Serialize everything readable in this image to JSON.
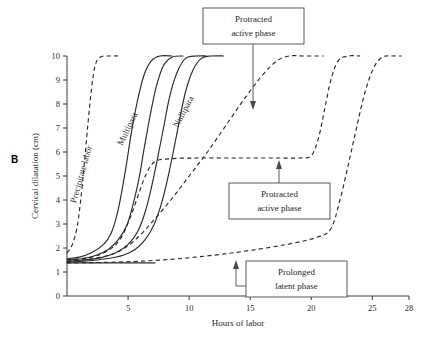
{
  "figure": {
    "panel_label": "B"
  },
  "chart_data": {
    "type": "line",
    "title": "",
    "xlabel": "Hours of labor",
    "ylabel": "Cervical dilatation (cm)",
    "xlim": [
      0,
      28
    ],
    "ylim": [
      0,
      10
    ],
    "xticks": [
      5,
      10,
      15,
      20,
      25,
      28
    ],
    "yticks": [
      0,
      1,
      2,
      3,
      4,
      5,
      6,
      7,
      8,
      9,
      10
    ],
    "xtick_labels": [
      "5",
      "10",
      "15",
      "20",
      "25",
      "28"
    ],
    "ytick_labels": [
      "0",
      "1",
      "2",
      "3",
      "4",
      "5",
      "6",
      "7",
      "8",
      "9",
      "10"
    ],
    "grid": false,
    "legend_position": "inline-curve-labels",
    "series": [
      {
        "name": "Precipitate labor",
        "style": "dashed",
        "label_on_curve": "Precipitate labor",
        "points": [
          [
            0.0,
            1.8
          ],
          [
            0.4,
            2.1
          ],
          [
            0.8,
            2.8
          ],
          [
            1.1,
            3.9
          ],
          [
            1.4,
            5.4
          ],
          [
            1.7,
            7.1
          ],
          [
            2.0,
            8.6
          ],
          [
            2.3,
            9.6
          ],
          [
            2.7,
            9.95
          ],
          [
            3.4,
            10.0
          ],
          [
            4.2,
            10.0
          ]
        ]
      },
      {
        "name": "Multipara (normal)",
        "style": "solid",
        "label_on_curve": "Multipara",
        "points": [
          [
            0.0,
            1.55
          ],
          [
            1.0,
            1.62
          ],
          [
            2.0,
            1.8
          ],
          [
            3.0,
            2.15
          ],
          [
            3.6,
            2.6
          ],
          [
            4.1,
            3.4
          ],
          [
            4.5,
            4.4
          ],
          [
            4.9,
            5.6
          ],
          [
            5.3,
            6.9
          ],
          [
            5.8,
            8.2
          ],
          [
            6.3,
            9.2
          ],
          [
            6.9,
            9.8
          ],
          [
            7.6,
            10.0
          ],
          [
            8.6,
            10.0
          ]
        ]
      },
      {
        "name": "Normal curve 2",
        "style": "solid",
        "label_on_curve": "",
        "points": [
          [
            0.0,
            1.5
          ],
          [
            1.2,
            1.55
          ],
          [
            2.4,
            1.7
          ],
          [
            3.4,
            1.95
          ],
          [
            4.2,
            2.35
          ],
          [
            4.9,
            2.95
          ],
          [
            5.4,
            3.8
          ],
          [
            5.9,
            4.9
          ],
          [
            6.3,
            6.1
          ],
          [
            6.8,
            7.5
          ],
          [
            7.3,
            8.7
          ],
          [
            7.9,
            9.6
          ],
          [
            8.6,
            9.95
          ],
          [
            9.5,
            10.0
          ]
        ]
      },
      {
        "name": "Normal curve 3",
        "style": "solid",
        "label_on_curve": "",
        "points": [
          [
            0.0,
            1.45
          ],
          [
            1.4,
            1.5
          ],
          [
            2.8,
            1.6
          ],
          [
            4.0,
            1.8
          ],
          [
            5.0,
            2.15
          ],
          [
            5.8,
            2.7
          ],
          [
            6.4,
            3.5
          ],
          [
            6.9,
            4.5
          ],
          [
            7.4,
            5.7
          ],
          [
            7.9,
            7.0
          ],
          [
            8.4,
            8.3
          ],
          [
            9.0,
            9.3
          ],
          [
            9.7,
            9.9
          ],
          [
            10.6,
            10.0
          ],
          [
            11.4,
            10.0
          ]
        ]
      },
      {
        "name": "Nullipara (normal)",
        "style": "solid",
        "label_on_curve": "Nullipara",
        "points": [
          [
            0.0,
            1.42
          ],
          [
            1.6,
            1.46
          ],
          [
            3.2,
            1.55
          ],
          [
            4.6,
            1.7
          ],
          [
            5.6,
            1.95
          ],
          [
            6.4,
            2.35
          ],
          [
            7.1,
            2.95
          ],
          [
            7.7,
            3.8
          ],
          [
            8.2,
            4.8
          ],
          [
            8.7,
            6.0
          ],
          [
            9.2,
            7.3
          ],
          [
            9.7,
            8.5
          ],
          [
            10.3,
            9.4
          ],
          [
            11.0,
            9.9
          ],
          [
            11.8,
            10.0
          ],
          [
            12.8,
            10.0
          ]
        ]
      },
      {
        "name": "Protracted active phase (slow slope)",
        "style": "dashed",
        "label_on_curve": "",
        "annotation": "Protracted active phase",
        "points": [
          [
            0.0,
            1.45
          ],
          [
            2.0,
            1.55
          ],
          [
            4.0,
            1.8
          ],
          [
            5.5,
            2.3
          ],
          [
            7.0,
            3.1
          ],
          [
            8.5,
            4.0
          ],
          [
            10.0,
            5.0
          ],
          [
            11.5,
            6.0
          ],
          [
            13.0,
            7.1
          ],
          [
            14.5,
            8.2
          ],
          [
            16.0,
            9.2
          ],
          [
            17.2,
            9.8
          ],
          [
            18.2,
            10.0
          ],
          [
            19.5,
            10.0
          ],
          [
            21.0,
            10.0
          ]
        ]
      },
      {
        "name": "Protracted active phase (arrest plateau)",
        "style": "dashed",
        "label_on_curve": "",
        "annotation": "Protracted active phase",
        "points": [
          [
            0.0,
            1.5
          ],
          [
            2.0,
            1.62
          ],
          [
            3.4,
            1.9
          ],
          [
            4.4,
            2.4
          ],
          [
            5.2,
            3.3
          ],
          [
            5.9,
            4.3
          ],
          [
            6.5,
            5.1
          ],
          [
            7.2,
            5.6
          ],
          [
            8.5,
            5.72
          ],
          [
            11.0,
            5.75
          ],
          [
            14.0,
            5.75
          ],
          [
            17.0,
            5.75
          ],
          [
            19.0,
            5.75
          ],
          [
            20.0,
            5.85
          ],
          [
            20.6,
            6.6
          ],
          [
            21.1,
            7.8
          ],
          [
            21.6,
            9.0
          ],
          [
            22.2,
            9.8
          ],
          [
            23.0,
            10.0
          ],
          [
            24.0,
            10.0
          ]
        ]
      },
      {
        "name": "Prolonged latent phase",
        "style": "dashed",
        "label_on_curve": "",
        "annotation": "Prolonged latent phase",
        "points": [
          [
            0.0,
            1.38
          ],
          [
            3.0,
            1.4
          ],
          [
            6.0,
            1.45
          ],
          [
            9.0,
            1.55
          ],
          [
            12.0,
            1.7
          ],
          [
            15.0,
            1.9
          ],
          [
            18.0,
            2.15
          ],
          [
            20.5,
            2.45
          ],
          [
            21.6,
            2.8
          ],
          [
            22.3,
            3.9
          ],
          [
            23.0,
            5.4
          ],
          [
            23.7,
            7.0
          ],
          [
            24.4,
            8.5
          ],
          [
            25.1,
            9.5
          ],
          [
            25.8,
            9.95
          ],
          [
            26.6,
            10.0
          ],
          [
            27.4,
            10.0
          ]
        ]
      },
      {
        "name": "Latent phase flat baseline",
        "style": "solid",
        "label_on_curve": "",
        "points": [
          [
            0.0,
            1.38
          ],
          [
            2.0,
            1.38
          ],
          [
            4.0,
            1.38
          ],
          [
            6.0,
            1.38
          ],
          [
            7.2,
            1.38
          ]
        ]
      }
    ],
    "annotations": [
      {
        "id": "protracted-active-top",
        "text_line1": "Protracted",
        "text_line2": "active phase"
      },
      {
        "id": "protracted-active-mid",
        "text_line1": "Protracted",
        "text_line2": "active phase"
      },
      {
        "id": "prolonged-latent",
        "text_line1": "Prolonged",
        "text_line2": "latent phase"
      }
    ],
    "curve_labels": [
      "Precipitate labor",
      "Multipara",
      "Nullipara"
    ]
  }
}
